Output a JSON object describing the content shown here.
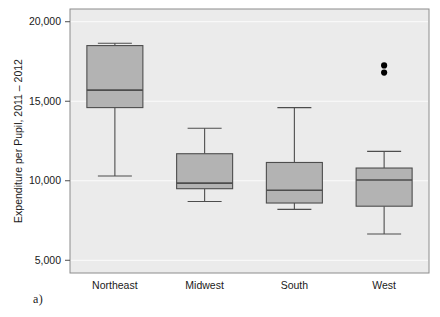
{
  "figure": {
    "caption": "a)"
  },
  "chart_data": {
    "type": "box",
    "title": "",
    "xlabel": "",
    "ylabel": "Expenditure per Pupil, 2011 – 2012",
    "ylim": [
      4200,
      20800
    ],
    "yticks": [
      5000,
      10000,
      15000,
      20000
    ],
    "ytick_labels": [
      "5,000",
      "10,000",
      "15,000",
      "20,000"
    ],
    "grid": "horizontal-light",
    "legend": "none",
    "plot_bg_color": "#ebebeb",
    "box_fill_color": "#b3b3b3",
    "box_line_color": "#4d4d4d",
    "outlier_color": "#000000",
    "categories": [
      "Northeast",
      "Midwest",
      "South",
      "West"
    ],
    "boxes": [
      {
        "category": "Northeast",
        "whisker_low": 10300,
        "q1": 14600,
        "median": 15700,
        "q3": 18500,
        "whisker_high": 18650,
        "outliers": []
      },
      {
        "category": "Midwest",
        "whisker_low": 8700,
        "q1": 9500,
        "median": 9850,
        "q3": 11700,
        "whisker_high": 13300,
        "outliers": []
      },
      {
        "category": "South",
        "whisker_low": 8200,
        "q1": 8600,
        "median": 9400,
        "q3": 11150,
        "whisker_high": 14600,
        "outliers": []
      },
      {
        "category": "West",
        "whisker_low": 6650,
        "q1": 8400,
        "median": 10050,
        "q3": 10800,
        "whisker_high": 11850,
        "outliers": [
          17250,
          16800
        ]
      }
    ]
  }
}
